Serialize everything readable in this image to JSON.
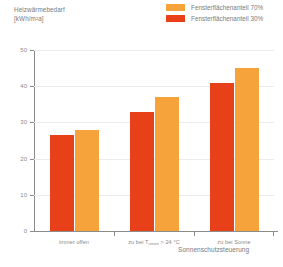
{
  "chart_data": {
    "type": "bar",
    "title": "Heizwärmebedarf [kWh/m²a]",
    "title_line1": "Heizwärmebedarf",
    "title_line2": "[kWh/m²a]",
    "xlabel": "Sonnenschutzsteuerung",
    "ylabel": "Heizwärmebedarf [kWh/m²a]",
    "ylim": [
      0,
      50
    ],
    "yticks": [
      0,
      10,
      20,
      30,
      40,
      50
    ],
    "ytick_labels": [
      "0",
      "10",
      "20",
      "30",
      "40",
      "50"
    ],
    "grid": true,
    "legend_position": "top-right",
    "categories": [
      "immer offen",
      "zu bei Tinnen > 24 °C",
      "zu bei Sonne"
    ],
    "category_labels": [
      {
        "prefix": "immer offen",
        "sub": "",
        "suffix": ""
      },
      {
        "prefix": "zu bei T",
        "sub": "innen",
        "suffix": " > 24 °C"
      },
      {
        "prefix": "zu bei Sonne",
        "sub": "",
        "suffix": ""
      }
    ],
    "series": [
      {
        "name": "Fensterflächenanteil 30%",
        "color": "#E8411A",
        "values": [
          26.5,
          33.0,
          41.0
        ]
      },
      {
        "name": "Fensterflächenanteil 70%",
        "color": "#F6A33C",
        "values": [
          28.0,
          37.0,
          45.0
        ]
      }
    ]
  },
  "legend": {
    "items": [
      {
        "label": "Fensterflächenanteil 70%",
        "color": "#F6A33C"
      },
      {
        "label": "Fensterflächenanteil 30%",
        "color": "#E8411A"
      }
    ]
  },
  "colors": {
    "red": "#E8411A",
    "orange": "#F6A33C",
    "axis": "#8c8c8c",
    "grid": "#ececec",
    "text": "#7a7a7a"
  }
}
